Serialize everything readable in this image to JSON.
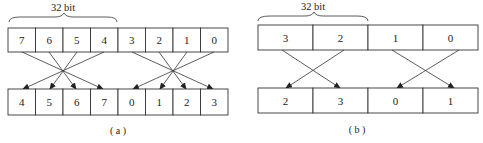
{
  "diagram_a": {
    "width_label": "32 bit",
    "caption": "( a )",
    "top_row": [
      "7",
      "6",
      "5",
      "4",
      "3",
      "2",
      "1",
      "0"
    ],
    "bottom_row": [
      "4",
      "5",
      "6",
      "7",
      "0",
      "1",
      "2",
      "3"
    ]
  },
  "diagram_b": {
    "width_label": "32 bit",
    "caption": "( b )",
    "top_row": [
      "3",
      "2",
      "1",
      "0"
    ],
    "bottom_row": [
      "2",
      "3",
      "0",
      "1"
    ]
  }
}
